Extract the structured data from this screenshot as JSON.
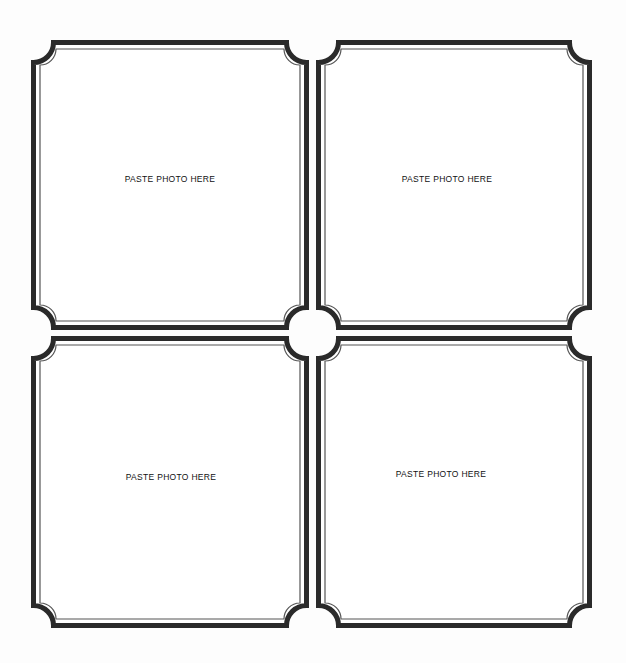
{
  "page": {
    "background": "#ffffff",
    "frame_stroke_color": "#2a2a2a",
    "inner_line_color": "#555555"
  },
  "frames": [
    {
      "position": "top-left",
      "label": "PASTE PHOTO HERE",
      "x": 31,
      "y": 40,
      "w": 278,
      "h": 290,
      "label_x": 170,
      "label_y": 179
    },
    {
      "position": "top-right",
      "label": "PASTE PHOTO HERE",
      "x": 316,
      "y": 40,
      "w": 276,
      "h": 290,
      "label_x": 447,
      "label_y": 179
    },
    {
      "position": "bottom-left",
      "label": "PASTE PHOTO HERE",
      "x": 31,
      "y": 336,
      "w": 278,
      "h": 292,
      "label_x": 171,
      "label_y": 477
    },
    {
      "position": "bottom-right",
      "label": "PASTE PHOTO HERE",
      "x": 316,
      "y": 336,
      "w": 276,
      "h": 292,
      "label_x": 441,
      "label_y": 474
    }
  ]
}
